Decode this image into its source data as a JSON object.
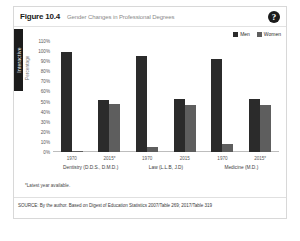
{
  "figure": {
    "number": "Figure 10.4",
    "title": "Gender Changes in Professional Degrees",
    "help_icon": "?",
    "interactive_tab": "Interactive",
    "footnote": "*Latest year available.",
    "source": "SOURCE: By the author. Based on Digest of Education Statistics 2007/Table 269; 2017/Table 319"
  },
  "colors": {
    "men": "#2b2b2b",
    "women": "#5e5e5e",
    "card_border": "#d8d8d8",
    "tab_background": "#1b1b1b"
  },
  "chart_data": {
    "type": "bar",
    "title": "Gender Changes in Professional Degrees",
    "xlabel": "",
    "ylabel": "Percentage",
    "ylim": [
      0,
      110
    ],
    "ytick_labels": [
      "110%",
      "100%",
      "90%",
      "80%",
      "70%",
      "60%",
      "50%",
      "40%",
      "30%",
      "20%",
      "10%",
      "0%"
    ],
    "ytick_values": [
      110,
      100,
      90,
      80,
      70,
      60,
      50,
      40,
      30,
      20,
      10,
      0
    ],
    "grid": false,
    "legend_position": "top-right",
    "legend": [
      "Men",
      "Women"
    ],
    "groups": [
      {
        "label": "Dentistry (D.D.S., D.M.D.)",
        "periods": [
          {
            "label": "1970",
            "men": 99,
            "women": 1
          },
          {
            "label": "2015*",
            "men": 52,
            "women": 48
          }
        ]
      },
      {
        "label": "Law (L.L.B, J.D)",
        "periods": [
          {
            "label": "1970",
            "men": 95,
            "women": 5
          },
          {
            "label": "2015",
            "men": 53,
            "women": 47
          }
        ]
      },
      {
        "label": "Medicine (M.D.)",
        "periods": [
          {
            "label": "1970",
            "men": 92,
            "women": 8
          },
          {
            "label": "2015*",
            "men": 53,
            "women": 47
          }
        ]
      }
    ]
  }
}
